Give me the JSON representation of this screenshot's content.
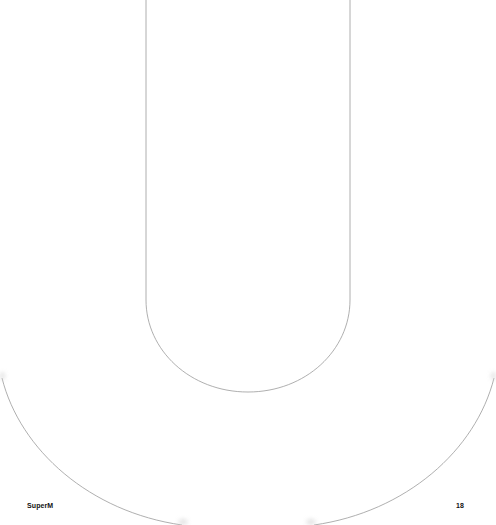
{
  "page": {
    "footer": {
      "brand": "SuperM",
      "page_number": "18"
    },
    "artwork": {
      "letter": "U",
      "style": "outline",
      "stroke_color": "#9a9a9a",
      "background_color": "#ffffff"
    }
  }
}
